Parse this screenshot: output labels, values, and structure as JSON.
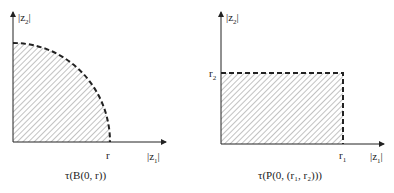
{
  "diagrams": [
    {
      "id": "ball",
      "shape": "quarter-disk",
      "y_axis_label": "|z",
      "y_axis_sub": "2",
      "x_axis_label": "|z",
      "x_axis_sub": "1",
      "radius_label": "r",
      "caption": "τ(B(0, r))"
    },
    {
      "id": "polydisc",
      "shape": "rectangle",
      "y_axis_label": "|z",
      "y_axis_sub": "2",
      "x_axis_label": "|z",
      "x_axis_sub": "1",
      "r1_label": "r",
      "r1_sub": "1",
      "r2_label": "r",
      "r2_sub": "2",
      "caption": "τ(P(0, (r₁, r₂)))"
    }
  ],
  "colors": {
    "ink": "#222222",
    "hatch": "#555555"
  }
}
